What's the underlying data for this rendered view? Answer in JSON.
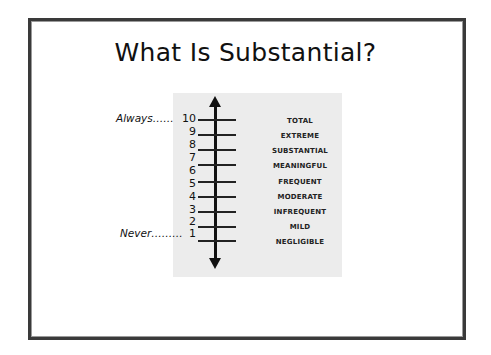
{
  "slide": {
    "title": "What Is Substantial?"
  },
  "scale": {
    "top_label": "Always……",
    "bottom_label": "Never………",
    "numbers": [
      "10",
      "9",
      "8",
      "7",
      "6",
      "5",
      "4",
      "3",
      "2",
      "1"
    ],
    "levels": [
      "TOTAL",
      "EXTREME",
      "SUBSTANTIAL",
      "MEANINGFUL",
      "FREQUENT",
      "MODERATE",
      "INFREQUENT",
      "MILD",
      "NEGLIGIBLE"
    ],
    "colors": {
      "panel": "#ececec",
      "ink": "#111111",
      "frame": "#3a3a3a"
    }
  }
}
